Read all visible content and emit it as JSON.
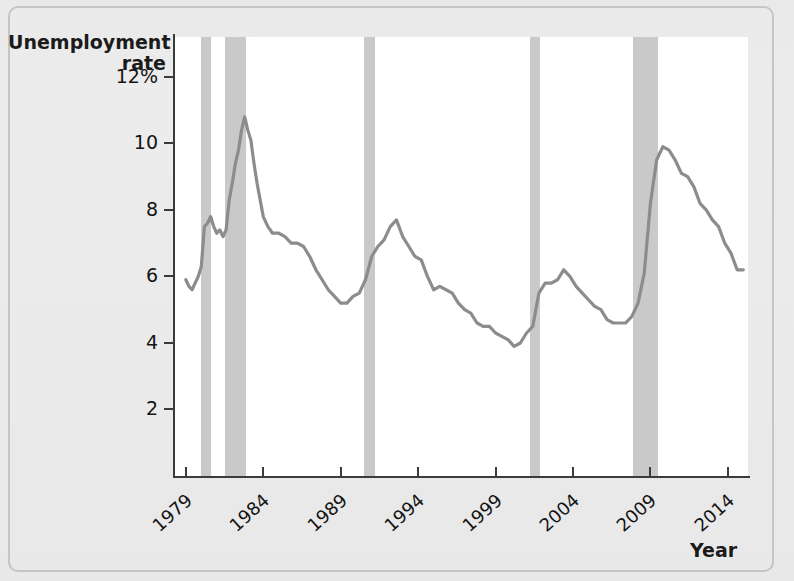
{
  "figure": {
    "y_axis_title_line1": "Unemployment",
    "y_axis_title_line2": "rate",
    "x_axis_title": "Year"
  },
  "chart_data": {
    "type": "line",
    "title": "",
    "xlabel": "Year",
    "ylabel": "Unemployment rate",
    "xlim": [
      1978.3,
      2015.3
    ],
    "ylim": [
      0,
      13.2
    ],
    "grid": false,
    "legend": "none",
    "y_ticks": [
      2,
      4,
      6,
      8,
      10,
      12
    ],
    "y_tick_labels": [
      "2",
      "4",
      "6",
      "8",
      "10",
      "12%"
    ],
    "x_ticks": [
      1979,
      1984,
      1989,
      1994,
      1999,
      2004,
      2009,
      2014
    ],
    "x_tick_labels": [
      "1979",
      "1984",
      "1989",
      "1994",
      "1999",
      "2004",
      "2009",
      "2014"
    ],
    "line_color": "#8c8c8c",
    "recession_band_color": "#c9c9c9",
    "recession_bands": [
      {
        "label": "1980 recession",
        "start": 1980.0,
        "end": 1980.6
      },
      {
        "label": "1981-82 recession",
        "start": 1981.5,
        "end": 1982.9
      },
      {
        "label": "1990-91 recession",
        "start": 1990.5,
        "end": 1991.2
      },
      {
        "label": "2001 recession",
        "start": 2001.2,
        "end": 2001.9
      },
      {
        "label": "2007-09 recession",
        "start": 2007.9,
        "end": 2009.5
      }
    ],
    "series": [
      {
        "name": "Unemployment rate",
        "x": [
          1979.0,
          1979.2,
          1979.4,
          1979.6,
          1979.8,
          1980.0,
          1980.2,
          1980.4,
          1980.6,
          1980.8,
          1981.0,
          1981.2,
          1981.4,
          1981.6,
          1981.8,
          1982.0,
          1982.2,
          1982.4,
          1982.6,
          1982.8,
          1983.0,
          1983.2,
          1983.4,
          1983.6,
          1983.8,
          1984.0,
          1984.3,
          1984.6,
          1985.0,
          1985.4,
          1985.8,
          1986.2,
          1986.6,
          1987.0,
          1987.4,
          1987.8,
          1988.2,
          1988.6,
          1989.0,
          1989.4,
          1989.8,
          1990.2,
          1990.6,
          1991.0,
          1991.4,
          1991.8,
          1992.2,
          1992.6,
          1993.0,
          1993.4,
          1993.8,
          1994.2,
          1994.6,
          1995.0,
          1995.4,
          1995.8,
          1996.2,
          1996.6,
          1997.0,
          1997.4,
          1997.8,
          1998.2,
          1998.6,
          1999.0,
          1999.4,
          1999.8,
          2000.2,
          2000.6,
          2001.0,
          2001.4,
          2001.8,
          2002.2,
          2002.6,
          2003.0,
          2003.4,
          2003.8,
          2004.2,
          2004.6,
          2005.0,
          2005.4,
          2005.8,
          2006.2,
          2006.6,
          2007.0,
          2007.4,
          2007.8,
          2008.2,
          2008.6,
          2009.0,
          2009.4,
          2009.8,
          2010.2,
          2010.6,
          2011.0,
          2011.4,
          2011.8,
          2012.2,
          2012.6,
          2013.0,
          2013.4,
          2013.8,
          2014.2,
          2014.6,
          2015.0
        ],
        "y": [
          5.9,
          5.7,
          5.6,
          5.8,
          6.0,
          6.3,
          7.5,
          7.6,
          7.8,
          7.5,
          7.3,
          7.4,
          7.2,
          7.4,
          8.3,
          8.8,
          9.4,
          9.8,
          10.4,
          10.8,
          10.4,
          10.1,
          9.4,
          8.8,
          8.3,
          7.8,
          7.5,
          7.3,
          7.3,
          7.2,
          7.0,
          7.0,
          6.9,
          6.6,
          6.2,
          5.9,
          5.6,
          5.4,
          5.2,
          5.2,
          5.4,
          5.5,
          5.9,
          6.6,
          6.9,
          7.1,
          7.5,
          7.7,
          7.2,
          6.9,
          6.6,
          6.5,
          6.0,
          5.6,
          5.7,
          5.6,
          5.5,
          5.2,
          5.0,
          4.9,
          4.6,
          4.5,
          4.5,
          4.3,
          4.2,
          4.1,
          3.9,
          4.0,
          4.3,
          4.5,
          5.5,
          5.8,
          5.8,
          5.9,
          6.2,
          6.0,
          5.7,
          5.5,
          5.3,
          5.1,
          5.0,
          4.7,
          4.6,
          4.6,
          4.6,
          4.8,
          5.2,
          6.1,
          8.2,
          9.5,
          9.9,
          9.8,
          9.5,
          9.1,
          9.0,
          8.7,
          8.2,
          8.0,
          7.7,
          7.5,
          7.0,
          6.7,
          6.2,
          6.2
        ]
      }
    ]
  }
}
